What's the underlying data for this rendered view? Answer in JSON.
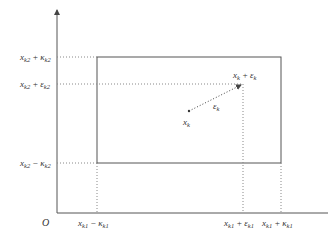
{
  "diagram": {
    "origin_label": "O",
    "y_labels": {
      "top": {
        "base": "x",
        "sub": "k2",
        "op": "+",
        "term": "κ",
        "term_sub": "k2"
      },
      "upper": {
        "base": "x",
        "sub": "k2",
        "op": "+",
        "term": "ε",
        "term_sub": "k2"
      },
      "bottom": {
        "base": "x",
        "sub": "k2",
        "op": "−",
        "term": "κ",
        "term_sub": "k2"
      }
    },
    "x_labels": {
      "left": {
        "base": "x",
        "sub": "k1",
        "op": "−",
        "term": "κ",
        "term_sub": "k1"
      },
      "mid": {
        "base": "x",
        "sub": "k1",
        "op": "+",
        "term": "ε",
        "term_sub": "k1"
      },
      "right": {
        "base": "x",
        "sub": "k1",
        "op": "+",
        "term": "κ",
        "term_sub": "k1"
      }
    },
    "point_label": {
      "base": "x",
      "sub": "k"
    },
    "vector_label": {
      "base": "ε",
      "sub": "k"
    },
    "target_label": {
      "base": "x",
      "sub": "k",
      "op": "+",
      "term": "ε",
      "term_sub": "k"
    },
    "colors": {
      "axis": "#555555",
      "box": "#555555",
      "dotted": "#888888"
    }
  }
}
